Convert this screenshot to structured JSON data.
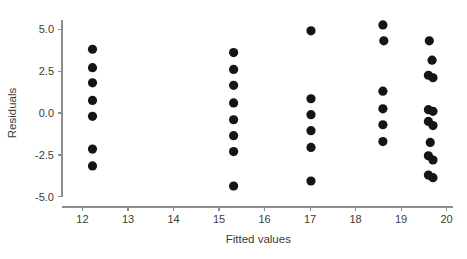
{
  "chart_data": {
    "type": "scatter",
    "title": "",
    "xlabel": "Fitted values",
    "ylabel": "Residuals",
    "xlim": [
      11.55,
      20.25
    ],
    "ylim": [
      -5.6,
      5.9
    ],
    "xticks": [
      12,
      13,
      14,
      15,
      16,
      17,
      18,
      19,
      20
    ],
    "xticklabels": [
      "12",
      "13",
      "14",
      "15",
      "16",
      "17",
      "18",
      "19",
      "20"
    ],
    "yticks": [
      -5.0,
      -2.5,
      0.0,
      2.5,
      5.0
    ],
    "yticklabels": [
      "-5.0",
      "-2.5",
      "0.0",
      "2.5",
      "5.0"
    ],
    "grid": false,
    "legend": null,
    "marker": "filled-circle",
    "marker_color": "#151515",
    "marker_size": 4.6,
    "axis_color": "#8d8d8d",
    "background_color": "#ffffff",
    "x": [
      12.22,
      12.22,
      12.22,
      12.22,
      12.22,
      12.22,
      12.22,
      15.32,
      15.32,
      15.32,
      15.32,
      15.32,
      15.32,
      15.32,
      15.32,
      17.02,
      17.02,
      17.02,
      17.02,
      17.02,
      17.02,
      18.6,
      18.62,
      18.6,
      18.6,
      18.6,
      18.6,
      19.62,
      19.68,
      19.6,
      19.7,
      19.6,
      19.7,
      19.6,
      19.7,
      19.64,
      19.6,
      19.7,
      19.6,
      19.7
    ],
    "y": [
      3.8,
      2.7,
      1.8,
      0.75,
      -0.2,
      -2.15,
      -3.15,
      3.6,
      2.6,
      1.65,
      0.6,
      -0.4,
      -1.35,
      -2.3,
      -4.35,
      4.9,
      0.85,
      -0.1,
      -1.05,
      -2.05,
      -4.05,
      5.25,
      4.3,
      1.3,
      0.25,
      -0.7,
      -1.7,
      4.3,
      3.15,
      2.25,
      2.1,
      0.2,
      0.1,
      -0.5,
      -0.75,
      -1.75,
      -2.55,
      -2.8,
      -3.7,
      -3.85
    ],
    "points": [
      {
        "x": 12.22,
        "y": 3.8
      },
      {
        "x": 12.22,
        "y": 2.7
      },
      {
        "x": 12.22,
        "y": 1.8
      },
      {
        "x": 12.22,
        "y": 0.75
      },
      {
        "x": 12.22,
        "y": -0.2
      },
      {
        "x": 12.22,
        "y": -2.15
      },
      {
        "x": 12.22,
        "y": -3.15
      },
      {
        "x": 15.32,
        "y": 3.6
      },
      {
        "x": 15.32,
        "y": 2.6
      },
      {
        "x": 15.32,
        "y": 1.65
      },
      {
        "x": 15.32,
        "y": 0.6
      },
      {
        "x": 15.32,
        "y": -0.4
      },
      {
        "x": 15.32,
        "y": -1.35
      },
      {
        "x": 15.32,
        "y": -2.3
      },
      {
        "x": 15.32,
        "y": -4.35
      },
      {
        "x": 17.02,
        "y": 4.9
      },
      {
        "x": 17.02,
        "y": 0.85
      },
      {
        "x": 17.02,
        "y": -0.1
      },
      {
        "x": 17.02,
        "y": -1.05
      },
      {
        "x": 17.02,
        "y": -2.05
      },
      {
        "x": 17.02,
        "y": -4.05
      },
      {
        "x": 18.6,
        "y": 5.25
      },
      {
        "x": 18.62,
        "y": 4.3
      },
      {
        "x": 18.6,
        "y": 1.3
      },
      {
        "x": 18.6,
        "y": 0.25
      },
      {
        "x": 18.6,
        "y": -0.7
      },
      {
        "x": 18.6,
        "y": -1.7
      },
      {
        "x": 19.62,
        "y": 4.3
      },
      {
        "x": 19.68,
        "y": 3.15
      },
      {
        "x": 19.6,
        "y": 2.25
      },
      {
        "x": 19.7,
        "y": 2.1
      },
      {
        "x": 19.6,
        "y": 0.2
      },
      {
        "x": 19.7,
        "y": 0.1
      },
      {
        "x": 19.6,
        "y": -0.5
      },
      {
        "x": 19.7,
        "y": -0.75
      },
      {
        "x": 19.64,
        "y": -1.75
      },
      {
        "x": 19.6,
        "y": -2.55
      },
      {
        "x": 19.7,
        "y": -2.8
      },
      {
        "x": 19.6,
        "y": -3.7
      },
      {
        "x": 19.7,
        "y": -3.85
      }
    ],
    "clusters": [
      {
        "fitted_value": 12.22,
        "count": 7
      },
      {
        "fitted_value": 15.32,
        "count": 8
      },
      {
        "fitted_value": 17.02,
        "count": 6
      },
      {
        "fitted_value": 18.6,
        "count": 6
      },
      {
        "fitted_value": 19.65,
        "count": 13
      }
    ]
  }
}
